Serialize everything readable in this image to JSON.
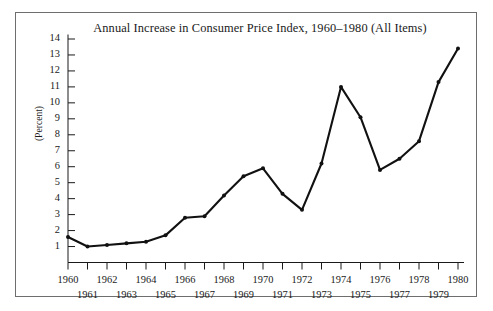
{
  "figure": {
    "title": "Annual Increase in Consumer Price Index, 1960–1980 (All Items)",
    "y_axis_title": "(Percent)",
    "border_color": "#6e6e6e",
    "line_color": "#111111",
    "background": "#ffffff"
  },
  "chart_data": {
    "type": "line",
    "title": "Annual Increase in Consumer Price Index, 1960–1980 (All Items)",
    "xlabel": "",
    "ylabel": "(Percent)",
    "x": [
      1960,
      1961,
      1962,
      1963,
      1964,
      1965,
      1966,
      1967,
      1968,
      1969,
      1970,
      1971,
      1972,
      1973,
      1974,
      1975,
      1976,
      1977,
      1978,
      1979,
      1980
    ],
    "values": [
      1.6,
      1.0,
      1.1,
      1.2,
      1.3,
      1.7,
      2.8,
      2.9,
      4.2,
      5.4,
      5.9,
      4.3,
      3.3,
      6.2,
      11.0,
      9.1,
      5.8,
      6.5,
      7.6,
      11.3,
      13.4
    ],
    "series": [
      {
        "name": "Annual increase in CPI (All Items)",
        "values": [
          1.6,
          1.0,
          1.1,
          1.2,
          1.3,
          1.7,
          2.8,
          2.9,
          4.2,
          5.4,
          5.9,
          4.3,
          3.3,
          6.2,
          11.0,
          9.1,
          5.8,
          6.5,
          7.6,
          11.3,
          13.4
        ]
      }
    ],
    "xlim": [
      1960,
      1980
    ],
    "ylim": [
      0,
      14.5
    ],
    "y_ticks": [
      1,
      2,
      3,
      4,
      5,
      6,
      7,
      8,
      9,
      10,
      11,
      12,
      13,
      14
    ],
    "y_tick_labels": [
      "1",
      "2",
      "3",
      "4",
      "5",
      "6",
      "7",
      "8",
      "9",
      "10",
      "11",
      "12",
      "13",
      "14"
    ],
    "x_ticks": [
      1960,
      1961,
      1962,
      1963,
      1964,
      1965,
      1966,
      1967,
      1968,
      1969,
      1970,
      1971,
      1972,
      1973,
      1974,
      1975,
      1976,
      1977,
      1978,
      1979,
      1980
    ],
    "x_tick_labels_upper": [
      "1960",
      "1962",
      "1964",
      "1966",
      "1968",
      "1970",
      "1972",
      "1974",
      "1976",
      "1978",
      "1980"
    ],
    "x_tick_labels_lower": [
      "1961",
      "1963",
      "1965",
      "1967",
      "1969",
      "1971",
      "1973",
      "1975",
      "1977",
      "1979"
    ],
    "grid": false,
    "legend": false,
    "markers": true
  }
}
